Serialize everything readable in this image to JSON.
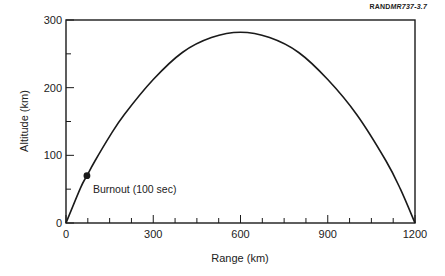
{
  "figure_id": {
    "prefix": "RAND",
    "suffix": "MR737-3.7"
  },
  "chart_data": {
    "type": "line",
    "title": "",
    "xlabel": "Range (km)",
    "ylabel": "Altitude (km)",
    "xlim": [
      0,
      1200
    ],
    "ylim": [
      0,
      300
    ],
    "x_ticks": [
      0,
      300,
      600,
      900,
      1200
    ],
    "y_ticks": [
      0,
      100,
      200,
      300
    ],
    "x_minor_tick_step": 75,
    "y_minor_tick_step": 50,
    "grid": false,
    "series": [
      {
        "name": "Ballistic trajectory",
        "x": [
          0,
          50,
          72,
          100,
          150,
          200,
          300,
          400,
          500,
          600,
          700,
          800,
          900,
          1000,
          1100,
          1150,
          1200
        ],
        "y": [
          0,
          52,
          70,
          92,
          128,
          160,
          212,
          252,
          274,
          282,
          274,
          252,
          212,
          160,
          92,
          50,
          0
        ]
      }
    ],
    "annotations": [
      {
        "label": "Burnout (100 sec)",
        "x": 72,
        "y": 70,
        "marker": "dot"
      }
    ]
  }
}
